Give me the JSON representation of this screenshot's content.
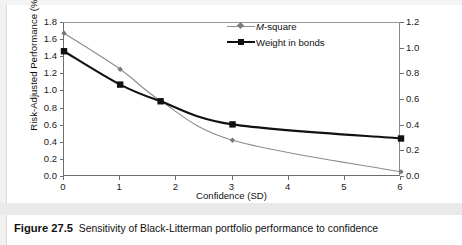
{
  "figure": {
    "caption_number": "Figure 27.5",
    "caption_text": "Sensitivity of Black-Litterman portfolio performance to confidence"
  },
  "chart_data": {
    "type": "line",
    "title": "",
    "xlabel": "Confidence (SD)",
    "ylabel": "Risk-Adjusted Performance (%)",
    "y2label": "",
    "xlim": [
      0,
      6
    ],
    "ylim": [
      0.0,
      1.8
    ],
    "y2lim": [
      0.0,
      1.2
    ],
    "xticks": [
      0,
      1,
      2,
      3,
      4,
      5,
      6
    ],
    "xtick_labels": [
      "0",
      "1",
      "2",
      "3",
      "4",
      "5",
      "6"
    ],
    "yticks": [
      0.0,
      0.2,
      0.4,
      0.6,
      0.8,
      1.0,
      1.2,
      1.4,
      1.6,
      1.8
    ],
    "ytick_labels": [
      "0.0",
      "0.2",
      "0.4",
      "0.6",
      "0.8",
      "1.0",
      "1.2",
      "1.4",
      "1.6",
      "1.8"
    ],
    "y2ticks": [
      0.0,
      0.2,
      0.4,
      0.6,
      0.8,
      1.0,
      1.2
    ],
    "y2tick_labels": [
      "0.0",
      "0.2",
      "0.4",
      "0.6",
      "0.8",
      "1.0",
      "1.2"
    ],
    "grid": false,
    "legend_position": "top-center-right",
    "series": [
      {
        "name": "M-square",
        "name_italic_prefix": "M",
        "name_rest": "-square",
        "axis": "left",
        "color": "#8d8d8d",
        "marker": "diamond",
        "x": [
          0,
          1,
          1.72,
          3,
          6
        ],
        "values": [
          1.68,
          1.26,
          0.89,
          0.43,
          0.06
        ]
      },
      {
        "name": "Weight in bonds",
        "axis": "right",
        "color": "#111111",
        "marker": "square",
        "x": [
          0,
          1,
          1.72,
          3,
          6
        ],
        "values": [
          0.98,
          0.72,
          0.59,
          0.41,
          0.3
        ]
      }
    ]
  }
}
